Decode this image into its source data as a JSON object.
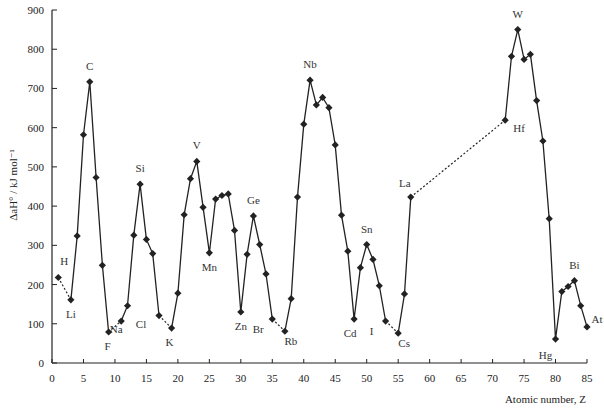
{
  "chart_data": {
    "type": "line",
    "title": "",
    "xlabel": "Atomic number, Z",
    "ylabel": "ΔaH° / kJ mol⁻¹",
    "xlim": [
      0,
      85
    ],
    "ylim": [
      0,
      900
    ],
    "xticks": [
      0,
      5,
      10,
      15,
      20,
      25,
      30,
      35,
      40,
      45,
      50,
      55,
      60,
      65,
      70,
      75,
      80,
      85
    ],
    "yticks": [
      0,
      100,
      200,
      300,
      400,
      500,
      600,
      700,
      800,
      900
    ],
    "grid": false,
    "series": [
      {
        "name": "H–Li",
        "style": "dotted",
        "points": [
          [
            1,
            218
          ],
          [
            3,
            161
          ]
        ]
      },
      {
        "name": "Li–F",
        "style": "solid",
        "points": [
          [
            3,
            161
          ],
          [
            4,
            324
          ],
          [
            5,
            582
          ],
          [
            6,
            717
          ],
          [
            7,
            473
          ],
          [
            8,
            249
          ],
          [
            9,
            79
          ]
        ]
      },
      {
        "name": "F–Na",
        "style": "dotted",
        "points": [
          [
            9,
            79
          ],
          [
            11,
            107
          ]
        ]
      },
      {
        "name": "Na–Cl",
        "style": "solid",
        "points": [
          [
            11,
            107
          ],
          [
            12,
            146
          ],
          [
            13,
            326
          ],
          [
            14,
            456
          ],
          [
            15,
            315
          ],
          [
            16,
            279
          ],
          [
            17,
            121
          ]
        ]
      },
      {
        "name": "Cl–K",
        "style": "dotted",
        "points": [
          [
            17,
            121
          ],
          [
            19,
            89
          ]
        ]
      },
      {
        "name": "K–Br",
        "style": "solid",
        "points": [
          [
            19,
            89
          ],
          [
            20,
            178
          ],
          [
            21,
            378
          ],
          [
            22,
            470
          ],
          [
            23,
            514
          ],
          [
            24,
            397
          ],
          [
            25,
            281
          ],
          [
            26,
            418
          ],
          [
            27,
            427
          ],
          [
            28,
            431
          ],
          [
            29,
            338
          ],
          [
            30,
            130
          ],
          [
            31,
            277
          ],
          [
            32,
            375
          ],
          [
            33,
            302
          ],
          [
            34,
            227
          ],
          [
            35,
            112
          ]
        ]
      },
      {
        "name": "Br–Rb",
        "style": "dotted",
        "points": [
          [
            35,
            112
          ],
          [
            37,
            81
          ]
        ]
      },
      {
        "name": "Rb–I",
        "style": "solid",
        "points": [
          [
            37,
            81
          ],
          [
            38,
            164
          ],
          [
            39,
            423
          ],
          [
            40,
            609
          ],
          [
            41,
            721
          ],
          [
            42,
            658
          ],
          [
            43,
            677
          ],
          [
            44,
            651
          ],
          [
            45,
            556
          ],
          [
            46,
            377
          ],
          [
            47,
            285
          ],
          [
            48,
            112
          ],
          [
            49,
            243
          ],
          [
            50,
            302
          ],
          [
            51,
            264
          ],
          [
            52,
            197
          ],
          [
            53,
            107
          ]
        ]
      },
      {
        "name": "I–Cs",
        "style": "dotted",
        "points": [
          [
            53,
            107
          ],
          [
            55,
            76
          ]
        ]
      },
      {
        "name": "Cs–La",
        "style": "solid",
        "points": [
          [
            55,
            76
          ],
          [
            56,
            176
          ],
          [
            57,
            423
          ]
        ]
      },
      {
        "name": "La–Hf",
        "style": "dotted",
        "points": [
          [
            57,
            423
          ],
          [
            72,
            619
          ]
        ]
      },
      {
        "name": "Hf–At",
        "style": "solid",
        "points": [
          [
            72,
            619
          ],
          [
            73,
            782
          ],
          [
            74,
            850
          ],
          [
            75,
            774
          ],
          [
            76,
            787
          ],
          [
            77,
            669
          ],
          [
            78,
            566
          ],
          [
            79,
            368
          ],
          [
            80,
            61
          ],
          [
            81,
            182
          ],
          [
            82,
            195
          ],
          [
            83,
            210
          ],
          [
            84,
            146
          ],
          [
            85,
            92
          ]
        ]
      }
    ],
    "markers": [
      [
        1,
        218
      ],
      [
        3,
        161
      ],
      [
        4,
        324
      ],
      [
        5,
        582
      ],
      [
        6,
        717
      ],
      [
        7,
        473
      ],
      [
        8,
        249
      ],
      [
        9,
        79
      ],
      [
        11,
        107
      ],
      [
        12,
        146
      ],
      [
        13,
        326
      ],
      [
        14,
        456
      ],
      [
        15,
        315
      ],
      [
        16,
        279
      ],
      [
        17,
        121
      ],
      [
        19,
        89
      ],
      [
        20,
        178
      ],
      [
        21,
        378
      ],
      [
        22,
        470
      ],
      [
        23,
        514
      ],
      [
        24,
        397
      ],
      [
        25,
        281
      ],
      [
        26,
        418
      ],
      [
        27,
        427
      ],
      [
        28,
        431
      ],
      [
        29,
        338
      ],
      [
        30,
        130
      ],
      [
        31,
        277
      ],
      [
        32,
        375
      ],
      [
        33,
        302
      ],
      [
        34,
        227
      ],
      [
        35,
        112
      ],
      [
        37,
        81
      ],
      [
        38,
        164
      ],
      [
        39,
        423
      ],
      [
        40,
        609
      ],
      [
        41,
        721
      ],
      [
        42,
        658
      ],
      [
        43,
        677
      ],
      [
        44,
        651
      ],
      [
        45,
        556
      ],
      [
        46,
        377
      ],
      [
        47,
        285
      ],
      [
        48,
        112
      ],
      [
        49,
        243
      ],
      [
        50,
        302
      ],
      [
        51,
        264
      ],
      [
        52,
        197
      ],
      [
        53,
        107
      ],
      [
        55,
        76
      ],
      [
        56,
        176
      ],
      [
        57,
        423
      ],
      [
        72,
        619
      ],
      [
        73,
        782
      ],
      [
        74,
        850
      ],
      [
        75,
        774
      ],
      [
        76,
        787
      ],
      [
        77,
        669
      ],
      [
        78,
        566
      ],
      [
        79,
        368
      ],
      [
        80,
        61
      ],
      [
        81,
        182
      ],
      [
        82,
        195
      ],
      [
        83,
        210
      ],
      [
        84,
        146
      ],
      [
        85,
        92
      ]
    ],
    "annotations": [
      {
        "text": "H",
        "x": 1,
        "y": 218,
        "dx": 6,
        "dy": -12
      },
      {
        "text": "Li",
        "x": 3,
        "y": 161,
        "dx": 0,
        "dy": 18
      },
      {
        "text": "C",
        "x": 6,
        "y": 717,
        "dx": 0,
        "dy": -12
      },
      {
        "text": "F",
        "x": 9,
        "y": 79,
        "dx": -1,
        "dy": 18
      },
      {
        "text": "Na",
        "x": 11,
        "y": 107,
        "dx": -5,
        "dy": 12
      },
      {
        "text": "Si",
        "x": 14,
        "y": 456,
        "dx": 0,
        "dy": -12
      },
      {
        "text": "Cl",
        "x": 17,
        "y": 121,
        "dx": -18,
        "dy": 12
      },
      {
        "text": "K",
        "x": 19,
        "y": 89,
        "dx": -2,
        "dy": 18
      },
      {
        "text": "V",
        "x": 23,
        "y": 514,
        "dx": 0,
        "dy": -12
      },
      {
        "text": "Mn",
        "x": 25,
        "y": 281,
        "dx": 0,
        "dy": 18
      },
      {
        "text": "Zn",
        "x": 30,
        "y": 130,
        "dx": 0,
        "dy": 18
      },
      {
        "text": "Ge",
        "x": 32,
        "y": 375,
        "dx": 0,
        "dy": -12
      },
      {
        "text": "Br",
        "x": 35,
        "y": 112,
        "dx": -14,
        "dy": 14
      },
      {
        "text": "Rb",
        "x": 37,
        "y": 81,
        "dx": 6,
        "dy": 14
      },
      {
        "text": "Nb",
        "x": 41,
        "y": 721,
        "dx": 0,
        "dy": -12
      },
      {
        "text": "Cd",
        "x": 48,
        "y": 112,
        "dx": -4,
        "dy": 18
      },
      {
        "text": "Sn",
        "x": 50,
        "y": 302,
        "dx": 0,
        "dy": -12
      },
      {
        "text": "I",
        "x": 53,
        "y": 107,
        "dx": -14,
        "dy": 14
      },
      {
        "text": "Cs",
        "x": 55,
        "y": 76,
        "dx": 6,
        "dy": 14
      },
      {
        "text": "La",
        "x": 57,
        "y": 423,
        "dx": -6,
        "dy": -10
      },
      {
        "text": "Hf",
        "x": 72,
        "y": 619,
        "dx": 14,
        "dy": 12
      },
      {
        "text": "W",
        "x": 74,
        "y": 850,
        "dx": 0,
        "dy": -12
      },
      {
        "text": "Hg",
        "x": 80,
        "y": 61,
        "dx": -10,
        "dy": 20
      },
      {
        "text": "Bi",
        "x": 83,
        "y": 210,
        "dx": 0,
        "dy": -12
      },
      {
        "text": "At",
        "x": 85,
        "y": 92,
        "dx": 10,
        "dy": -4
      }
    ]
  }
}
